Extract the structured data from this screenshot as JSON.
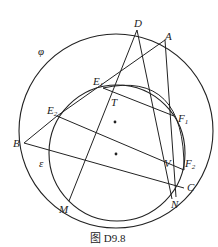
{
  "caption": "图 D9.8",
  "labels": {
    "phi": "φ",
    "epsilon": "ε",
    "D": "D",
    "A": "A",
    "E1": "E",
    "E1sub": "1",
    "E2": "E",
    "E2sub": "2",
    "T": "T",
    "F1": "F",
    "F1sub": "1",
    "B": "B",
    "V": "V",
    "F2": "F",
    "F2sub": "2",
    "C": "C",
    "M": "M",
    "N": "N"
  },
  "circles": {
    "phi": {
      "cx": 116,
      "cy": 131,
      "r": 97
    },
    "epsilon": {
      "cx": 117,
      "cy": 153,
      "r": 68
    }
  },
  "points": {
    "D": [
      137,
      30
    ],
    "A": [
      165,
      40
    ],
    "B": [
      24,
      143
    ],
    "M": [
      69,
      201
    ],
    "N": [
      172,
      199
    ],
    "C": [
      184,
      188
    ],
    "E1": [
      103,
      88
    ],
    "E2": [
      57,
      116
    ],
    "F1": [
      174,
      116
    ],
    "F2": [
      184,
      170
    ],
    "T": [
      113,
      95
    ],
    "V": [
      163,
      169
    ]
  },
  "centers": [
    [
      115,
      122
    ],
    [
      116,
      154
    ]
  ]
}
